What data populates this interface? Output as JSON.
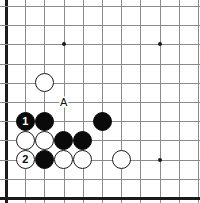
{
  "board": {
    "title": "Go board diagram",
    "background_color": "#ffffff",
    "line_color": "#888c8e",
    "edge_color": "#1b1b1b",
    "black_color": "#0a0a0a",
    "white_color": "#ffffff",
    "origin_x": 6,
    "origin_y": 6,
    "spacing": 19.2,
    "cols": 11,
    "rows": 11,
    "edges": [
      "left",
      "bottom"
    ],
    "star_points": [
      {
        "col": 3,
        "row": 2
      },
      {
        "col": 8,
        "row": 2
      },
      {
        "col": 8,
        "row": 8
      }
    ],
    "stones": [
      {
        "col": 2,
        "row": 4,
        "color": "white",
        "label": ""
      },
      {
        "col": 1,
        "row": 6,
        "color": "black",
        "label": "1"
      },
      {
        "col": 2,
        "row": 6,
        "color": "black",
        "label": ""
      },
      {
        "col": 5,
        "row": 6,
        "color": "black",
        "label": ""
      },
      {
        "col": 1,
        "row": 7,
        "color": "white",
        "label": ""
      },
      {
        "col": 2,
        "row": 7,
        "color": "white",
        "label": ""
      },
      {
        "col": 3,
        "row": 7,
        "color": "black",
        "label": ""
      },
      {
        "col": 4,
        "row": 7,
        "color": "black",
        "label": ""
      },
      {
        "col": 1,
        "row": 8,
        "color": "white",
        "label": "2"
      },
      {
        "col": 2,
        "row": 8,
        "color": "black",
        "label": ""
      },
      {
        "col": 3,
        "row": 8,
        "color": "white",
        "label": ""
      },
      {
        "col": 4,
        "row": 8,
        "color": "white",
        "label": ""
      },
      {
        "col": 6,
        "row": 8,
        "color": "white",
        "label": ""
      }
    ],
    "point_labels": [
      {
        "col": 3,
        "row": 5,
        "text": "A"
      }
    ]
  }
}
